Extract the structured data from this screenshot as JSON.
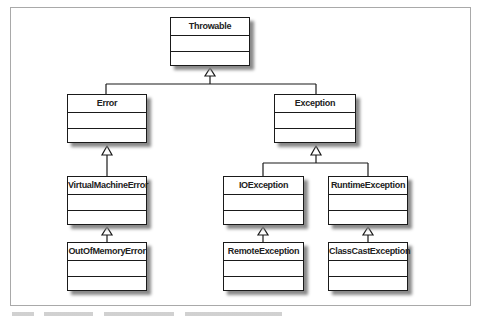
{
  "diagram": {
    "type": "UML class hierarchy",
    "classes": [
      {
        "id": "throwable",
        "name": "Throwable"
      },
      {
        "id": "error",
        "name": "Error"
      },
      {
        "id": "exception",
        "name": "Exception"
      },
      {
        "id": "virtualmachineerror",
        "name": "VirtualMachineError"
      },
      {
        "id": "ioexception",
        "name": "IOException"
      },
      {
        "id": "runtimeexception",
        "name": "RuntimeException"
      },
      {
        "id": "outofmemoryerror",
        "name": "OutOfMemoryError"
      },
      {
        "id": "remoteexception",
        "name": "RemoteException"
      },
      {
        "id": "classcastexception",
        "name": "ClassCastException"
      }
    ],
    "inheritance": [
      {
        "child": "Error",
        "parent": "Throwable"
      },
      {
        "child": "Exception",
        "parent": "Throwable"
      },
      {
        "child": "VirtualMachineError",
        "parent": "Error"
      },
      {
        "child": "IOException",
        "parent": "Exception"
      },
      {
        "child": "RuntimeException",
        "parent": "Exception"
      },
      {
        "child": "OutOfMemoryError",
        "parent": "VirtualMachineError"
      },
      {
        "child": "RemoteException",
        "parent": "IOException"
      },
      {
        "child": "ClassCastException",
        "parent": "RuntimeException"
      }
    ],
    "colors": {
      "line": "#1a1a1a",
      "shadow": "#8a8a8a",
      "frame": "#a9a9a9"
    }
  }
}
